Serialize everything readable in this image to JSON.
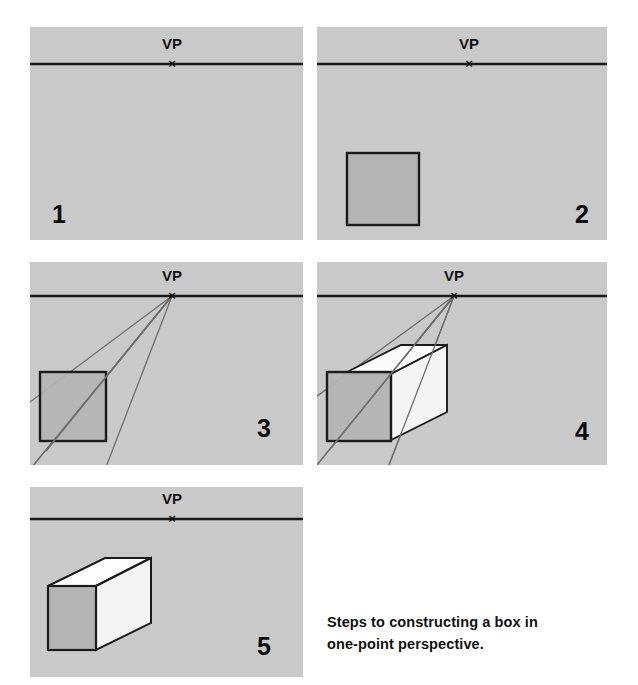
{
  "figure": {
    "caption_line1": "Steps to constructing a box in",
    "caption_line2": "one-point perspective.",
    "panel_background": "#c9c9c9",
    "page_background": "#ffffff",
    "ink_color": "#1a1a1a",
    "front_face_fill": "#b4b4b4",
    "top_face_fill": "#fbfbfb",
    "side_face_fill": "#f2f2f2",
    "guide_line_color": "#6e6e6e"
  },
  "panels": [
    {
      "step_number": "1",
      "vp_label": "VP",
      "vp_mark": "×",
      "description": "Horizon line with vanishing point",
      "has_square": false,
      "has_guides": false,
      "has_box": false
    },
    {
      "step_number": "2",
      "vp_label": "VP",
      "vp_mark": "×",
      "description": "Front square of the box drawn",
      "has_square": true,
      "has_guides": false,
      "has_box": false
    },
    {
      "step_number": "3",
      "vp_label": "VP",
      "vp_mark": "×",
      "description": "Guide lines drawn from square corners to vanishing point",
      "has_square": true,
      "has_guides": true,
      "has_box": false
    },
    {
      "step_number": "4",
      "vp_label": "VP",
      "vp_mark": "×",
      "description": "Back edges added to form the box along the guide lines",
      "has_square": true,
      "has_guides": true,
      "has_box": true
    },
    {
      "step_number": "5",
      "vp_label": "VP",
      "vp_mark": "×",
      "description": "Guide lines erased leaving the finished box",
      "has_square": false,
      "has_guides": false,
      "has_box": true
    }
  ]
}
